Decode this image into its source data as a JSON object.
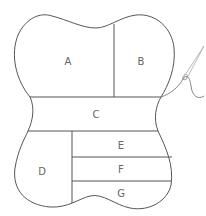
{
  "diagram": {
    "sections": [
      {
        "id": "A",
        "label": "A",
        "x": 68,
        "y": 62
      },
      {
        "id": "B",
        "label": "B",
        "x": 141,
        "y": 62
      },
      {
        "id": "C",
        "label": "C",
        "x": 96,
        "y": 115
      },
      {
        "id": "D",
        "label": "D",
        "x": 42,
        "y": 172
      },
      {
        "id": "E",
        "label": "E",
        "x": 121,
        "y": 146
      },
      {
        "id": "F",
        "label": "F",
        "x": 121,
        "y": 170
      },
      {
        "id": "G",
        "label": "G",
        "x": 121,
        "y": 194
      }
    ],
    "colors": {
      "outline": "#555555",
      "label": "#666666",
      "needle": "#aaaaaa",
      "thread": "#777777",
      "background": "#ffffff"
    }
  }
}
